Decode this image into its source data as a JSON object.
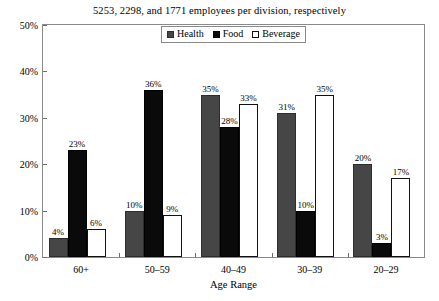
{
  "chart_data": {
    "type": "bar",
    "title": "5253, 2298, and 1771 employees per division, respectively",
    "xlabel": "Age Range",
    "ylabel": "",
    "ylim": [
      0,
      50
    ],
    "yticks": [
      "0%",
      "10%",
      "20%",
      "30%",
      "40%",
      "50%"
    ],
    "ytick_values": [
      0,
      10,
      20,
      30,
      40,
      50
    ],
    "grid": false,
    "legend_position": "top-center-inside",
    "categories": [
      "60+",
      "50–59",
      "40–49",
      "30–39",
      "20–29"
    ],
    "series": [
      {
        "name": "Health",
        "color": "#464646",
        "values": [
          4,
          10,
          35,
          31,
          20
        ],
        "labels": [
          "4%",
          "10%",
          "35%",
          "31%",
          "20%"
        ]
      },
      {
        "name": "Food",
        "color": "#0a0a0a",
        "values": [
          23,
          36,
          28,
          10,
          3
        ],
        "labels": [
          "23%",
          "36%",
          "28%",
          "10%",
          "3%"
        ]
      },
      {
        "name": "Beverage",
        "color": "#ffffff",
        "values": [
          6,
          9,
          33,
          35,
          17
        ],
        "labels": [
          "6%",
          "9%",
          "33%",
          "35%",
          "17%"
        ]
      }
    ]
  },
  "legend": {
    "items": [
      {
        "label": "Health",
        "swatch": "swatch-gray"
      },
      {
        "label": "Food",
        "swatch": "swatch-black"
      },
      {
        "label": "Beverage",
        "swatch": "swatch-white"
      }
    ]
  },
  "colors": {
    "health": "#464646",
    "food": "#0a0a0a",
    "beverage": "#ffffff",
    "axis": "#8a8a8a",
    "text": "#000000",
    "background": "#ffffff"
  }
}
